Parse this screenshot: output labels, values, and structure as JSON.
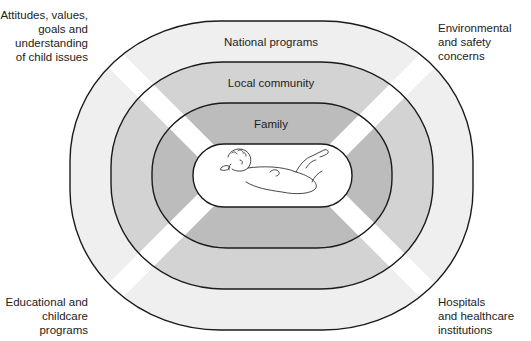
{
  "diagram": {
    "rings": [
      {
        "id": "national",
        "label": "National programs",
        "fill": "#efefef"
      },
      {
        "id": "local",
        "label": "Local community",
        "fill": "#d3d3d3"
      },
      {
        "id": "family",
        "label": "Family",
        "fill": "#bcbcbc"
      },
      {
        "id": "child",
        "label": "",
        "fill": "#ffffff",
        "content": "infant-illustration"
      }
    ],
    "band_color": "#ffffff",
    "outline_color": "#1a1a1a"
  },
  "corner_labels": {
    "top_left": [
      "Attitudes, values,",
      "goals and",
      "understanding",
      "of child issues"
    ],
    "top_right": [
      "Environmental",
      "and safety",
      "concerns"
    ],
    "bottom_left": [
      "Educational and",
      "childcare",
      "programs"
    ],
    "bottom_right": [
      "Hospitals",
      "and healthcare",
      "institutions"
    ]
  }
}
